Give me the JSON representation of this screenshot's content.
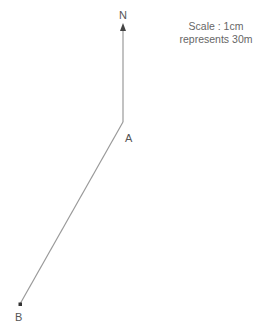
{
  "diagram": {
    "north_label": "N",
    "point_a_label": "A",
    "point_b_label": "B",
    "scale_line1": "Scale : 1cm",
    "scale_line2": "represents 30m",
    "line_color": "#888888"
  }
}
